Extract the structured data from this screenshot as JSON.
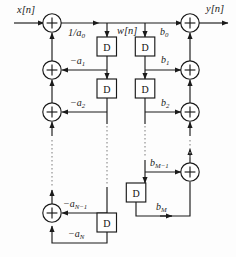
{
  "diagram": {
    "type": "block-diagram",
    "canvas": {
      "width": 236,
      "height": 257
    },
    "colors": {
      "stroke": "#1a1a1a",
      "background": "#fdfdfd",
      "dotted": "#8a8a8a",
      "text": "#1a1a1a"
    },
    "delay_block_label": "D",
    "adder_symbol": "+",
    "signals": {
      "input": "x[n]",
      "output": "y[n]",
      "intermediate": "w[n]",
      "input_gain": "1/a",
      "input_gain_sub": "0"
    },
    "feedback_coefficients": [
      {
        "base": "−a",
        "sub": "1",
        "name": "minus-a1"
      },
      {
        "base": "−a",
        "sub": "2",
        "name": "minus-a2"
      },
      {
        "base": "−a",
        "sub": "N−1",
        "name": "minus-a-n-minus-1"
      },
      {
        "base": "−a",
        "sub": "N",
        "name": "minus-aN"
      }
    ],
    "feedforward_coefficients": [
      {
        "base": "b",
        "sub": "0",
        "name": "b0"
      },
      {
        "base": "b",
        "sub": "1",
        "name": "b1"
      },
      {
        "base": "b",
        "sub": "2",
        "name": "b2"
      },
      {
        "base": "b",
        "sub": "M−1",
        "name": "b-m-minus-1"
      },
      {
        "base": "b",
        "sub": "M",
        "name": "bM"
      }
    ],
    "delay_blocks": {
      "feedback_chain_count": 3,
      "feedforward_chain_count": 3,
      "label": "D"
    },
    "adders": {
      "feedback_column_count": 4,
      "feedforward_column_count": 4
    }
  }
}
